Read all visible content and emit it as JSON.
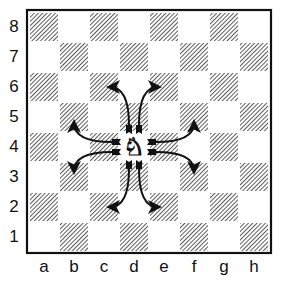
{
  "diagram": {
    "files": [
      "a",
      "b",
      "c",
      "d",
      "e",
      "f",
      "g",
      "h"
    ],
    "ranks": [
      "8",
      "7",
      "6",
      "5",
      "4",
      "3",
      "2",
      "1"
    ],
    "colors": {
      "light": "#ffffff",
      "dark_hatch": "#333333",
      "border": "#111111",
      "arrow": "#111111"
    },
    "piece": {
      "type": "knight",
      "color": "white",
      "square": "d4",
      "glyph": "♞"
    },
    "moves": [
      {
        "from": "d4",
        "to": "c6"
      },
      {
        "from": "d4",
        "to": "e6"
      },
      {
        "from": "d4",
        "to": "b5"
      },
      {
        "from": "d4",
        "to": "f5"
      },
      {
        "from": "d4",
        "to": "b3"
      },
      {
        "from": "d4",
        "to": "f3"
      },
      {
        "from": "d4",
        "to": "c2"
      },
      {
        "from": "d4",
        "to": "e2"
      }
    ]
  }
}
